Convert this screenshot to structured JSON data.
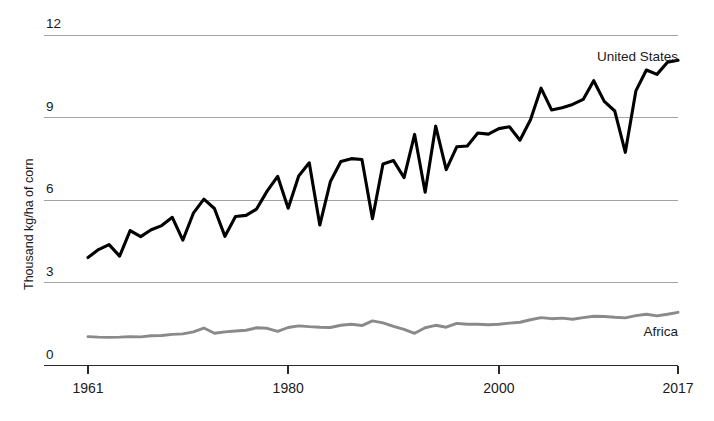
{
  "chart_data": {
    "type": "line",
    "title": "",
    "xlabel": "",
    "ylabel": "Thousand kg/ha of corn",
    "xlim": [
      1961,
      2017
    ],
    "ylim": [
      0,
      12
    ],
    "grid": true,
    "grid_axis": "y",
    "legend": "inline-end-labels",
    "y_ticks": [
      "0",
      "3",
      "6",
      "9",
      "12"
    ],
    "y_tick_values": [
      0,
      3,
      6,
      9,
      12
    ],
    "x_ticks": [
      "1961",
      "1980",
      "2000",
      "2017"
    ],
    "x_tick_values": [
      1961,
      1980,
      2000,
      2017
    ],
    "x": [
      1961,
      1962,
      1963,
      1964,
      1965,
      1966,
      1967,
      1968,
      1969,
      1970,
      1971,
      1972,
      1973,
      1974,
      1975,
      1976,
      1977,
      1978,
      1979,
      1980,
      1981,
      1982,
      1983,
      1984,
      1985,
      1986,
      1987,
      1988,
      1989,
      1990,
      1991,
      1992,
      1993,
      1994,
      1995,
      1996,
      1997,
      1998,
      1999,
      2000,
      2001,
      2002,
      2003,
      2004,
      2005,
      2006,
      2007,
      2008,
      2009,
      2010,
      2011,
      2012,
      2013,
      2014,
      2015,
      2016,
      2017
    ],
    "series": [
      {
        "name": "United States",
        "color": "#000000",
        "label_x": 2014,
        "label_y": 10.6,
        "values": [
          3.92,
          4.21,
          4.39,
          3.97,
          4.9,
          4.68,
          4.93,
          5.08,
          5.38,
          4.55,
          5.53,
          6.04,
          5.7,
          4.69,
          5.41,
          5.45,
          5.68,
          6.33,
          6.87,
          5.71,
          6.88,
          7.36,
          5.1,
          6.67,
          7.41,
          7.51,
          7.48,
          5.33,
          7.32,
          7.44,
          6.82,
          8.39,
          6.29,
          8.69,
          7.11,
          7.94,
          7.97,
          8.44,
          8.4,
          8.6,
          8.67,
          8.18,
          8.92,
          10.07,
          9.28,
          9.36,
          9.48,
          9.66,
          10.34,
          9.59,
          9.24,
          7.74,
          9.97,
          10.73,
          10.57,
          11.01,
          11.08
        ]
      },
      {
        "name": "Africa",
        "color": "#8a8a8a",
        "label_x": 2014,
        "label_y": 1.15,
        "values": [
          1.05,
          1.03,
          1.02,
          1.03,
          1.05,
          1.04,
          1.08,
          1.09,
          1.13,
          1.15,
          1.22,
          1.36,
          1.17,
          1.22,
          1.25,
          1.28,
          1.37,
          1.35,
          1.24,
          1.38,
          1.44,
          1.41,
          1.39,
          1.38,
          1.46,
          1.5,
          1.45,
          1.62,
          1.55,
          1.42,
          1.31,
          1.17,
          1.37,
          1.46,
          1.39,
          1.53,
          1.5,
          1.5,
          1.48,
          1.5,
          1.54,
          1.57,
          1.66,
          1.74,
          1.7,
          1.72,
          1.68,
          1.74,
          1.79,
          1.78,
          1.75,
          1.73,
          1.81,
          1.86,
          1.8,
          1.86,
          1.93
        ]
      }
    ]
  },
  "labels": {
    "y_axis_title": "Thousand kg/ha of corn",
    "series_us": "United States",
    "series_africa": "Africa"
  }
}
